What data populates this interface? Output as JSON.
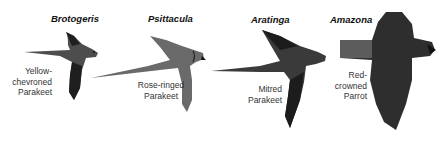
{
  "figure": {
    "birds": [
      {
        "genus": "Brotogeris",
        "common_name": "Yellow-\nchevroned\nParakeet"
      },
      {
        "genus": "Psittacula",
        "common_name": "Rose-ringed\nParakeet"
      },
      {
        "genus": "Aratinga",
        "common_name": "Mitred\nParakeet"
      },
      {
        "genus": "Amazona",
        "common_name": "Red-\ncrowned\nParrot"
      }
    ],
    "colors": {
      "bird_dark": "#2a2a2a",
      "bird_mid": "#555555",
      "bird_light": "#8a8a8a",
      "background": "#ffffff"
    }
  }
}
